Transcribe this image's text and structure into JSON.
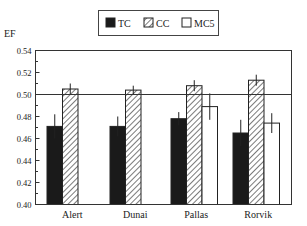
{
  "chart_data": {
    "type": "bar",
    "title": "",
    "xlabel": "",
    "ylabel": "EF",
    "ylim": [
      0.4,
      0.54
    ],
    "yticks": [
      0.4,
      0.42,
      0.44,
      0.46,
      0.48,
      0.5,
      0.52,
      0.54
    ],
    "ytick_labels": [
      "0.40",
      "0.42",
      "0.44",
      "0.46",
      "0.48",
      "0.50",
      "0.52",
      "0.54"
    ],
    "grid": false,
    "reference_line": 0.5,
    "legend_position": "top-center",
    "categories": [
      "Alert",
      "Dunai",
      "Pallas",
      "Rorvik"
    ],
    "series": [
      {
        "name": "TC",
        "fill": "solid-black",
        "values": [
          0.471,
          0.471,
          0.478,
          0.465
        ],
        "errors": [
          0.011,
          0.009,
          0.006,
          0.012
        ]
      },
      {
        "name": "CC",
        "fill": "diagonal-hatch",
        "values": [
          0.505,
          0.504,
          0.508,
          0.513
        ],
        "errors": [
          0.005,
          0.004,
          0.005,
          0.005
        ]
      },
      {
        "name": "MC5",
        "fill": "white",
        "values": [
          null,
          null,
          0.489,
          0.474
        ],
        "errors": [
          null,
          null,
          0.012,
          0.009
        ]
      }
    ]
  },
  "legend": {
    "items": [
      {
        "label": "TC",
        "swatch": "solid"
      },
      {
        "label": "CC",
        "swatch": "hatch"
      },
      {
        "label": "MC5",
        "swatch": "empty"
      }
    ]
  },
  "axis": {
    "ylabel": "EF"
  },
  "colors": {
    "tc": "#1a1a1a",
    "frame": "#333333"
  }
}
